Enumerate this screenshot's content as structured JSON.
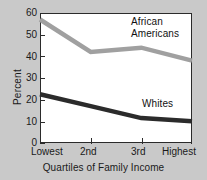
{
  "chart_data": {
    "type": "line",
    "title": "",
    "xlabel": "Quartiles of Family Income",
    "ylabel": "Percent",
    "categories": [
      "Lowest",
      "2nd",
      "3rd",
      "Highest"
    ],
    "ylim": [
      0,
      60
    ],
    "yticks": [
      0,
      10,
      20,
      30,
      40,
      50,
      60
    ],
    "grid": false,
    "legend_position": "inline-annotations",
    "series": [
      {
        "name": "African Americans",
        "color": "#a0a0a0",
        "values": [
          57,
          42,
          44,
          38
        ]
      },
      {
        "name": "Whites",
        "color": "#2b2b2b",
        "values": [
          22.5,
          17,
          11.5,
          10
        ]
      }
    ],
    "annotations": [
      {
        "text": "African\nAmericans",
        "series": "African Americans"
      },
      {
        "text": "Whites",
        "series": "Whites"
      }
    ]
  },
  "axes": {
    "y": {
      "title": "Percent",
      "ticks": [
        "60",
        "50",
        "40",
        "30",
        "20",
        "10",
        "0"
      ]
    },
    "x": {
      "title": "Quartiles of Family Income",
      "ticks": [
        "Lowest",
        "2nd",
        "3rd",
        "Highest"
      ]
    }
  },
  "labels": {
    "african_americans": "African\nAmericans",
    "whites": "Whites"
  },
  "cut_title": ""
}
